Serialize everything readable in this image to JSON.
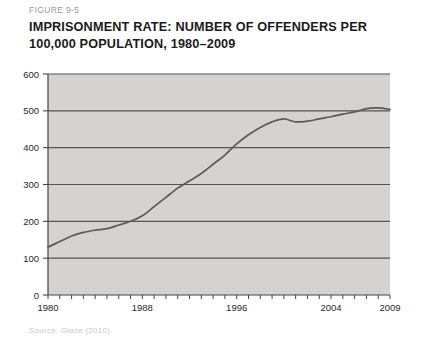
{
  "figure": {
    "label": "FIGURE 9-5",
    "title_line1": "IMPRISONMENT RATE: NUMBER OF OFFENDERS PER",
    "title_line2": "100,000 POPULATION, 1980–2009",
    "source": "Source: Glaze (2010)."
  },
  "colors": {
    "plot_background": "#d4d3d1",
    "gridline": "#555555",
    "axis": "#444444",
    "series_line": "#5a5a5a",
    "label_text": "#1b1b1b",
    "figure_label_text": "#9a9a9a",
    "source_text": "#c9c9c9",
    "page_background": "#ffffff"
  },
  "chart_data": {
    "type": "line",
    "title": "IMPRISONMENT RATE: NUMBER OF OFFENDERS PER 100,000 POPULATION, 1980–2009",
    "xlabel": "",
    "ylabel": "",
    "xlim": [
      1980,
      2009
    ],
    "ylim": [
      0,
      600
    ],
    "grid": true,
    "legend": "none",
    "ytick_labels": [
      "0",
      "100",
      "200",
      "300",
      "400",
      "500",
      "600"
    ],
    "ytick_values": [
      0,
      100,
      200,
      300,
      400,
      500,
      600
    ],
    "xtick_labels": [
      "1980",
      "1988",
      "1996",
      "2004",
      "2009"
    ],
    "xtick_values": [
      1980,
      1988,
      1996,
      2004,
      2009
    ],
    "x_minor_tick_interval": 1,
    "series": [
      {
        "name": "Imprisonment rate per 100,000 population",
        "x": [
          1980,
          1981,
          1982,
          1983,
          1984,
          1985,
          1986,
          1987,
          1988,
          1989,
          1990,
          1991,
          1992,
          1993,
          1994,
          1995,
          1996,
          1997,
          1998,
          1999,
          2000,
          2001,
          2002,
          2003,
          2004,
          2005,
          2006,
          2007,
          2008,
          2009
        ],
        "values": [
          130,
          145,
          160,
          170,
          176,
          180,
          190,
          200,
          215,
          240,
          265,
          290,
          310,
          330,
          355,
          380,
          410,
          435,
          455,
          470,
          478,
          470,
          472,
          478,
          484,
          491,
          497,
          506,
          508,
          504
        ]
      }
    ]
  }
}
